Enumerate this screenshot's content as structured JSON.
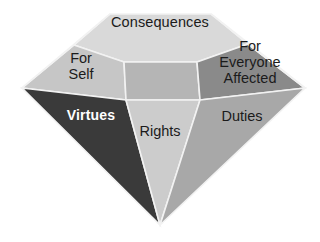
{
  "diagram": {
    "name": "ethical-decision-diamond",
    "shape": "diamond",
    "background_color": "#ffffff",
    "facets": [
      {
        "id": "consequences",
        "label": "Consequences",
        "fill": "#d9d9d9",
        "text_color": "#1b1b1b"
      },
      {
        "id": "for-self",
        "label": "For\nSelf",
        "fill": "#c6c6c6",
        "text_color": "#1b1b1b"
      },
      {
        "id": "for-everyone-affected",
        "label": "For\nEveryone\nAffected",
        "fill": "#8a8a8a",
        "text_color": "#1b1b1b"
      },
      {
        "id": "center-crown",
        "label": "",
        "fill": "#b5b5b5",
        "text_color": "#1b1b1b"
      },
      {
        "id": "virtues",
        "label": "Virtues",
        "fill": "#3a3a3a",
        "text_color": "#ffffff"
      },
      {
        "id": "rights",
        "label": "Rights",
        "fill": "#cccccc",
        "text_color": "#1b1b1b"
      },
      {
        "id": "duties",
        "label": "Duties",
        "fill": "#a8a8a8",
        "text_color": "#1b1b1b"
      }
    ],
    "edge_color": "#f2f2f2",
    "labels": {
      "consequences": "Consequences",
      "for_self": "For\nSelf",
      "for_everyone_affected": "For\nEveryone\nAffected",
      "virtues": "Virtues",
      "rights": "Rights",
      "duties": "Duties"
    }
  }
}
